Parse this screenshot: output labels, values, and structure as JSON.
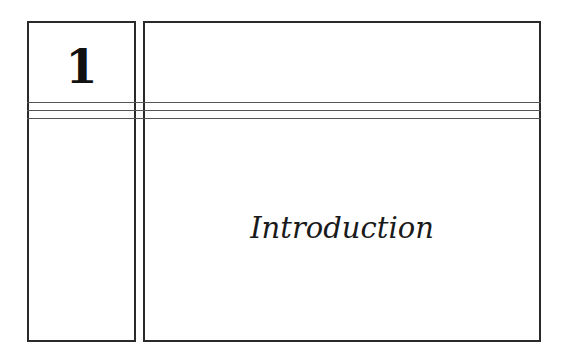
{
  "chapter": {
    "number": "1",
    "title": "Introduction"
  },
  "colors": {
    "border": "#2a2a2a",
    "text": "#1a1a1a",
    "background": "#ffffff"
  }
}
